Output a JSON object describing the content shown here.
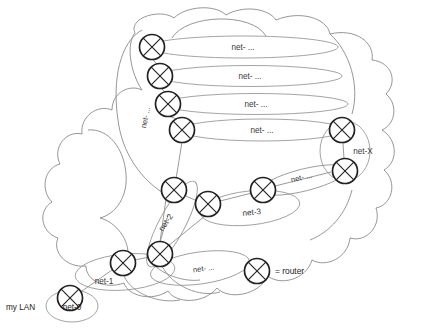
{
  "diagram": {
    "colors": {
      "cloud_stroke": "#8a8a8a",
      "ellipse_stroke": "#9a9a9a",
      "link_stroke": "#8f8f8f",
      "router_stroke": "#222222",
      "text": "#3b3b3b",
      "background": "#ffffff"
    },
    "lan": {
      "caption": "my LAN",
      "network_label": "net-0"
    },
    "networks": [
      {
        "id": "top-1",
        "label": "net- ..."
      },
      {
        "id": "top-2",
        "label": "net- ..."
      },
      {
        "id": "top-3",
        "label": "net- ..."
      },
      {
        "id": "top-4",
        "label": "net- ..."
      },
      {
        "id": "spine",
        "label": "net- ..."
      },
      {
        "id": "right-x",
        "label": "net-X"
      },
      {
        "id": "right-diag",
        "label": "net- ..."
      },
      {
        "id": "mid-3",
        "label": "net-3"
      },
      {
        "id": "mid-2",
        "label": "net-2"
      },
      {
        "id": "low-1",
        "label": "net-1"
      },
      {
        "id": "low-dots",
        "label": "net- ..."
      }
    ],
    "legend": {
      "symbol_name": "router-symbol",
      "text": "= router"
    },
    "routers": [
      {
        "id": "r-top-1",
        "cx": 152,
        "cy": 47
      },
      {
        "id": "r-top-2",
        "cx": 160,
        "cy": 76
      },
      {
        "id": "r-top-3",
        "cx": 168,
        "cy": 104
      },
      {
        "id": "r-top-4",
        "cx": 182,
        "cy": 130
      },
      {
        "id": "r-right-upper",
        "cx": 342,
        "cy": 130
      },
      {
        "id": "r-right-lower",
        "cx": 345,
        "cy": 171
      },
      {
        "id": "r-mid-left",
        "cx": 174,
        "cy": 190
      },
      {
        "id": "r-mid-center",
        "cx": 208,
        "cy": 204
      },
      {
        "id": "r-mid-right",
        "cx": 263,
        "cy": 190
      },
      {
        "id": "r-low-center",
        "cx": 160,
        "cy": 254
      },
      {
        "id": "r-low-left",
        "cx": 123,
        "cy": 263
      },
      {
        "id": "r-net0",
        "cx": 70,
        "cy": 298
      },
      {
        "id": "r-legend",
        "cx": 257,
        "cy": 271
      }
    ]
  }
}
